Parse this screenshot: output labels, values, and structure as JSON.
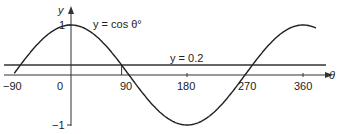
{
  "chart_data": {
    "type": "line",
    "title": "",
    "xlabel": "θ",
    "ylabel": "y",
    "x_ticks": [
      "-90",
      "0",
      "90",
      "180",
      "270",
      "360"
    ],
    "y_ticks": [
      "1",
      "-1"
    ],
    "xlim": [
      -100,
      385
    ],
    "ylim": [
      -1,
      1
    ],
    "grid": false,
    "series": [
      {
        "name": "y = cos θ°",
        "function": "cos(theta_degrees)",
        "x_range": [
          -90,
          390
        ],
        "sample_x": [
          -90,
          0,
          90,
          180,
          270,
          360
        ],
        "sample_y": [
          0,
          1,
          0,
          -1,
          0,
          1
        ]
      },
      {
        "name": "y = 0.2",
        "function": "constant",
        "value": 0.2
      }
    ],
    "annotations": [
      {
        "type": "vertical-segment",
        "x": 78.5,
        "from_y": 0,
        "to_y": 0.2,
        "note": "intersection of cos θ with y=0.2"
      }
    ]
  },
  "labels": {
    "y_axis": "y",
    "x_axis": "θ",
    "cos_curve": "y = cos θ°",
    "line_02": "y = 0.2",
    "tick_neg90": "−90",
    "tick_0": "0",
    "tick_90": "90",
    "tick_180": "180",
    "tick_270": "270",
    "tick_360": "360",
    "ytick_1": "1",
    "ytick_neg1": "−1"
  }
}
